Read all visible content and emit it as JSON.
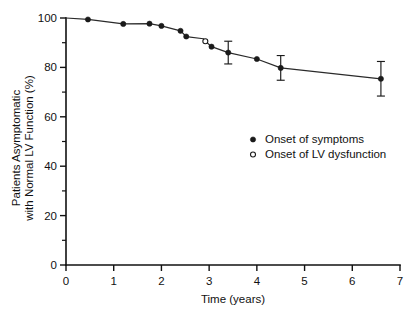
{
  "chart_data": {
    "type": "line",
    "title": "",
    "subtitle": "",
    "xlabel": "Time (years)",
    "ylabel": "Patients Asymptomatic with Normal LV Function (%)",
    "ylabel_line1": "Patients Asymptomatic",
    "ylabel_line2": "with Normal LV Function (%)",
    "xlim": [
      0,
      7
    ],
    "ylim": [
      0,
      100
    ],
    "xticks": [
      0,
      1,
      2,
      3,
      4,
      5,
      6,
      7
    ],
    "xticklabels": [
      "0",
      "1",
      "2",
      "3",
      "4",
      "5",
      "6",
      "7"
    ],
    "yticks": [
      0,
      20,
      40,
      60,
      80,
      100
    ],
    "yticklabels": [
      "0",
      "20",
      "40",
      "60",
      "80",
      "100"
    ],
    "yticks_minor": [
      10,
      30,
      50,
      70,
      90
    ],
    "grid": false,
    "legend_position": "center-right",
    "legend": [
      {
        "label": "Onset of symptoms",
        "marker": "filled-circle"
      },
      {
        "label": "Onset of LV dysfunction",
        "marker": "open-circle"
      }
    ],
    "series": [
      {
        "name": "Event-free survival",
        "marker": "filled-circle",
        "line_color": "#2a2a2a",
        "x": [
          0,
          0.46,
          1.2,
          1.75,
          2.0,
          2.4,
          2.52,
          2.88,
          2.92,
          3.05,
          3.4,
          4.0,
          4.5,
          6.6
        ],
        "y": [
          100.0,
          99.4,
          97.6,
          97.7,
          96.8,
          94.8,
          92.5,
          91.6,
          90.6,
          88.4,
          86.0,
          83.4,
          79.8,
          75.4
        ],
        "marker_points": [
          {
            "x": 0.46,
            "y": 99.4,
            "marker": "filled-circle"
          },
          {
            "x": 1.2,
            "y": 97.6,
            "marker": "filled-circle"
          },
          {
            "x": 1.75,
            "y": 97.7,
            "marker": "filled-circle"
          },
          {
            "x": 2.0,
            "y": 96.8,
            "marker": "filled-circle"
          },
          {
            "x": 2.4,
            "y": 94.8,
            "marker": "filled-circle"
          },
          {
            "x": 2.52,
            "y": 92.5,
            "marker": "filled-circle"
          },
          {
            "x": 2.92,
            "y": 90.6,
            "marker": "open-circle"
          },
          {
            "x": 3.05,
            "y": 88.4,
            "marker": "filled-circle"
          },
          {
            "x": 3.4,
            "y": 86.0,
            "marker": "filled-circle"
          },
          {
            "x": 4.0,
            "y": 83.4,
            "marker": "filled-circle"
          },
          {
            "x": 4.5,
            "y": 79.8,
            "marker": "filled-circle"
          },
          {
            "x": 6.6,
            "y": 75.4,
            "marker": "filled-circle"
          }
        ],
        "error_bars": [
          {
            "x": 3.4,
            "y": 86.0,
            "err_low": 4.6,
            "err_high": 4.6
          },
          {
            "x": 4.5,
            "y": 79.8,
            "err_low": 5.0,
            "err_high": 5.0
          },
          {
            "x": 6.6,
            "y": 75.4,
            "err_low": 7.0,
            "err_high": 7.0
          }
        ]
      }
    ]
  },
  "colors": {
    "background": "#ffffff",
    "axis": "#111111",
    "line": "#2a2a2a",
    "marker": "#1a1a1a"
  }
}
